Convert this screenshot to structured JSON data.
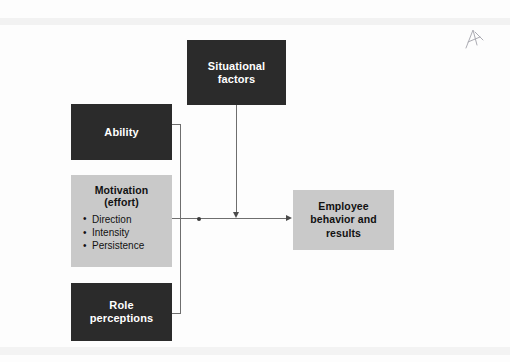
{
  "diagram": {
    "nodes": {
      "situational": {
        "label": "Situational\nfactors",
        "style": "dark",
        "color": "#2b2b2b",
        "text_color": "#ffffff"
      },
      "ability": {
        "label": "Ability",
        "style": "dark",
        "color": "#2b2b2b",
        "text_color": "#ffffff"
      },
      "motivation": {
        "label": "Motivation\n(effort)",
        "style": "light",
        "color": "#c9c9c9",
        "text_color": "#111111",
        "bullets": [
          "Direction",
          "Intensity",
          "Persistence"
        ]
      },
      "role": {
        "label": "Role\nperceptions",
        "style": "dark",
        "color": "#2b2b2b",
        "text_color": "#ffffff"
      },
      "employee": {
        "label": "Employee\nbehavior and\nresults",
        "style": "light",
        "color": "#c9c9c9",
        "text_color": "#111111"
      }
    },
    "connector_color": "#6e6e6e",
    "arrowhead_color": "#4a4a4a"
  },
  "annotation": {
    "pen_mark": "handwritten-initial-mark"
  }
}
